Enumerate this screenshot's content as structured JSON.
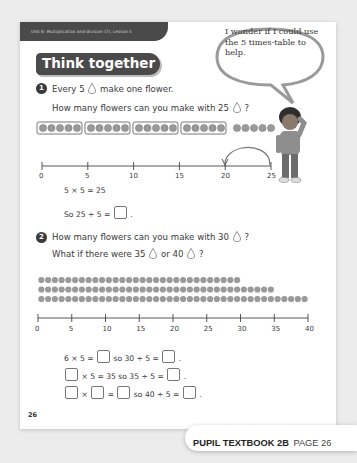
{
  "header": {
    "unit_label": "Unit 6: Multiplication and division (2), Lesson 5",
    "section_title": "Think together"
  },
  "speech_bubble": {
    "text": "I wonder if I could use the 5 times-table to help."
  },
  "question1": {
    "number": "1",
    "line1_before": "Every 5",
    "line1_after": "make one flower.",
    "line2_before": "How many flowers can you make with 25",
    "line2_after": "?",
    "counters": {
      "groups_boxed": 4,
      "group_size": 5,
      "loose": 5,
      "total": 25
    },
    "number_line": {
      "ticks": [
        "0",
        "5",
        "10",
        "15",
        "20",
        "25"
      ],
      "min": 0,
      "max": 25,
      "jump_from": 25,
      "jump_to": 20
    },
    "eq1": "5 × 5 = 25",
    "eq2_before": "So 25 ÷ 5 =",
    "eq2_after": "."
  },
  "question2": {
    "number": "2",
    "line1_before": "How many flowers can you make with 30",
    "line1_after": "?",
    "line2_a": "What if there were 35",
    "line2_b": "or 40",
    "line2_c": "?",
    "dot_rows": [
      30,
      35,
      40
    ],
    "number_line": {
      "ticks": [
        "0",
        "5",
        "10",
        "15",
        "20",
        "25",
        "30",
        "35",
        "40"
      ],
      "min": 0,
      "max": 40
    },
    "eq1_a": "6 × 5 =",
    "eq1_b": "so 30 ÷ 5 =",
    "eq1_c": ".",
    "eq2_a": "× 5 = 35 so 35 ÷ 5 =",
    "eq2_b": ".",
    "eq3_a": "×",
    "eq3_b": "=",
    "eq3_c": "so 40 ÷ 5 =",
    "eq3_d": "."
  },
  "page_number": "26",
  "footer": {
    "book": "PUPIL TEXTBOOK 2B",
    "page": "PAGE 26"
  },
  "colors": {
    "banner": "#4a4a4a",
    "counter": "#9a9a9a",
    "background": "#ececec"
  }
}
